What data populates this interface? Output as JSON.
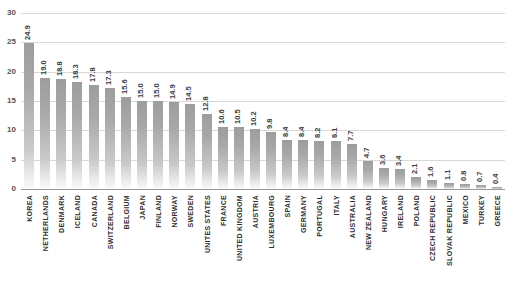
{
  "chart_data": {
    "type": "bar",
    "title": "",
    "xlabel": "",
    "ylabel": "",
    "ylim": [
      0,
      30
    ],
    "yticks": [
      "0",
      "5",
      "10",
      "15",
      "20",
      "25",
      "30"
    ],
    "grid": true,
    "legend": "none",
    "orientation": "vertical",
    "value_labels_rotated": true,
    "categories": [
      "KOREA",
      "NETHERLANDS",
      "DENMARK",
      "ICELAND",
      "CANADA",
      "SWITZERLAND",
      "BELGIUM",
      "JAPAN",
      "FINLAND",
      "NORWAY",
      "SWEDEN",
      "UNITES STATES",
      "FRANCE",
      "UNITED KINGDOM",
      "AUSTRIA",
      "LUXEMBOURG",
      "SPAIN",
      "GERMANY",
      "PORTUGAL",
      "ITALY",
      "AUSTRALIA",
      "NEW ZEALAND",
      "HUNGARY",
      "IRELAND",
      "POLAND",
      "CZECH REPUBLIC",
      "SLOVAK REPUBLIC",
      "MEXICO",
      "TURKEY",
      "GREECE"
    ],
    "values": [
      24.9,
      19.0,
      18.8,
      18.3,
      17.8,
      17.3,
      15.6,
      15.0,
      15.0,
      14.9,
      14.5,
      12.8,
      10.6,
      10.5,
      10.2,
      9.8,
      8.4,
      8.4,
      8.2,
      8.1,
      7.7,
      4.7,
      3.6,
      3.4,
      2.1,
      1.6,
      1.1,
      0.8,
      0.7,
      0.4
    ],
    "value_labels": [
      "24.9",
      "19.0",
      "18.8",
      "18.3",
      "17.8",
      "17.3",
      "15.6",
      "15.0",
      "15.0",
      "14.9",
      "14.5",
      "12.8",
      "10.6",
      "10.5",
      "10.2",
      "9.8",
      "8.4",
      "8.4",
      "8.2",
      "8.1",
      "7.7",
      "4.7",
      "3.6",
      "3.4",
      "2.1",
      "1.6",
      "1.1",
      "0.8",
      "0.7",
      "0.4"
    ]
  },
  "colors": {
    "bar_top": "#9d9d9d",
    "bar_bottom": "#fafafa",
    "gridline": "#d8d8d8",
    "baseline": "#9a9a9a",
    "label_text": "#2e2e2e",
    "tick_text": "#555555",
    "background": "#ffffff"
  }
}
